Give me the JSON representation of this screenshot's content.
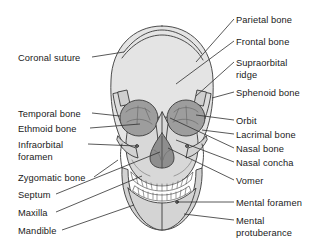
{
  "figure": {
    "background_color": "#ffffff",
    "line_color": "#3a3a3a",
    "text_color": "#1a1a1a",
    "fills": {
      "cranium": "#e4e4e4",
      "face": "#d8d8d8",
      "orbit": "#9d9d9d",
      "nasal_aperture": "#8e8e8e",
      "teeth": "#ffffff",
      "mandible": "#d2d2d2"
    }
  },
  "labels": {
    "left": [
      {
        "id": "coronal-suture",
        "text": "Coronal suture",
        "lines": [
          "Coronal suture"
        ],
        "x": 18,
        "y": 53,
        "leader": {
          "x1": 92,
          "y1": 57,
          "x2": 124,
          "y2": 52
        }
      },
      {
        "id": "temporal-bone",
        "text": "Temporal bone",
        "lines": [
          "Temporal bone"
        ],
        "x": 18,
        "y": 109,
        "leader": {
          "x1": 92,
          "y1": 113,
          "x2": 120,
          "y2": 116
        }
      },
      {
        "id": "ethmoid-bone",
        "text": "Ethmoid bone",
        "lines": [
          "Ethmoid bone"
        ],
        "x": 18,
        "y": 124,
        "leader": {
          "x1": 90,
          "y1": 128,
          "x2": 140,
          "y2": 124
        }
      },
      {
        "id": "infraorbital-foramen",
        "text": "Infraorbital foramen",
        "lines": [
          "Infraorbital",
          "foramen"
        ],
        "x": 18,
        "y": 140,
        "leader": {
          "x1": 88,
          "y1": 144,
          "x2": 137,
          "y2": 146
        }
      },
      {
        "id": "zygomatic-bone",
        "text": "Zygomatic bone",
        "lines": [
          "Zygomatic bone"
        ],
        "x": 18,
        "y": 173,
        "leader": {
          "x1": 94,
          "y1": 177,
          "x2": 118,
          "y2": 160
        }
      },
      {
        "id": "septum",
        "text": "Septum",
        "lines": [
          "Septum"
        ],
        "x": 18,
        "y": 190,
        "leader": {
          "x1": 56,
          "y1": 194,
          "x2": 160,
          "y2": 152
        }
      },
      {
        "id": "maxilla",
        "text": "Maxilla",
        "lines": [
          "Maxilla"
        ],
        "x": 18,
        "y": 208,
        "leader": {
          "x1": 56,
          "y1": 212,
          "x2": 142,
          "y2": 176
        }
      },
      {
        "id": "mandible",
        "text": "Mandible",
        "lines": [
          "Mandible"
        ],
        "x": 18,
        "y": 226,
        "leader": {
          "x1": 62,
          "y1": 230,
          "x2": 134,
          "y2": 205
        }
      }
    ],
    "right": [
      {
        "id": "parietal-bone",
        "text": "Parietal bone",
        "lines": [
          "Parietal bone"
        ],
        "x": 236,
        "y": 15,
        "leader": {
          "x1": 234,
          "y1": 19,
          "x2": 196,
          "y2": 62
        }
      },
      {
        "id": "frontal-bone",
        "text": "Frontal bone",
        "lines": [
          "Frontal bone"
        ],
        "x": 236,
        "y": 37,
        "leader": {
          "x1": 234,
          "y1": 41,
          "x2": 176,
          "y2": 84
        }
      },
      {
        "id": "supraorbital-ridge",
        "text": "Supraorbital ridge",
        "lines": [
          "Supraorbital",
          "ridge"
        ],
        "x": 236,
        "y": 58,
        "leader": {
          "x1": 234,
          "y1": 62,
          "x2": 196,
          "y2": 96
        }
      },
      {
        "id": "sphenoid-bone",
        "text": "Sphenoid bone",
        "lines": [
          "Sphenoid bone"
        ],
        "x": 236,
        "y": 88,
        "leader": {
          "x1": 234,
          "y1": 92,
          "x2": 212,
          "y2": 98
        }
      },
      {
        "id": "orbit",
        "text": "Orbit",
        "lines": [
          "Orbit"
        ],
        "x": 236,
        "y": 116,
        "leader": {
          "x1": 234,
          "y1": 120,
          "x2": 196,
          "y2": 115
        }
      },
      {
        "id": "lacrimal-bone",
        "text": "Lacrimal bone",
        "lines": [
          "Lacrimal bone"
        ],
        "x": 236,
        "y": 130,
        "leader": {
          "x1": 234,
          "y1": 134,
          "x2": 202,
          "y2": 130
        }
      },
      {
        "id": "nasal-bone",
        "text": "Nasal bone",
        "lines": [
          "Nasal bone"
        ],
        "x": 236,
        "y": 144,
        "leader": {
          "x1": 234,
          "y1": 148,
          "x2": 170,
          "y2": 118
        }
      },
      {
        "id": "nasal-concha",
        "text": "Nasal concha",
        "lines": [
          "Nasal concha"
        ],
        "x": 236,
        "y": 158,
        "leader": {
          "x1": 234,
          "y1": 162,
          "x2": 176,
          "y2": 140
        }
      },
      {
        "id": "vomer",
        "text": "Vomer",
        "lines": [
          "Vomer"
        ],
        "x": 236,
        "y": 176,
        "leader": {
          "x1": 234,
          "y1": 180,
          "x2": 168,
          "y2": 148
        }
      },
      {
        "id": "mental-foramen",
        "text": "Mental foramen",
        "lines": [
          "Mental foramen"
        ],
        "x": 236,
        "y": 198,
        "leader": {
          "x1": 234,
          "y1": 202,
          "x2": 177,
          "y2": 202
        }
      },
      {
        "id": "mental-protuberance",
        "text": "Mental protuberance",
        "lines": [
          "Mental",
          "protuberance"
        ],
        "x": 236,
        "y": 216,
        "leader": {
          "x1": 234,
          "y1": 220,
          "x2": 184,
          "y2": 214
        }
      }
    ]
  }
}
